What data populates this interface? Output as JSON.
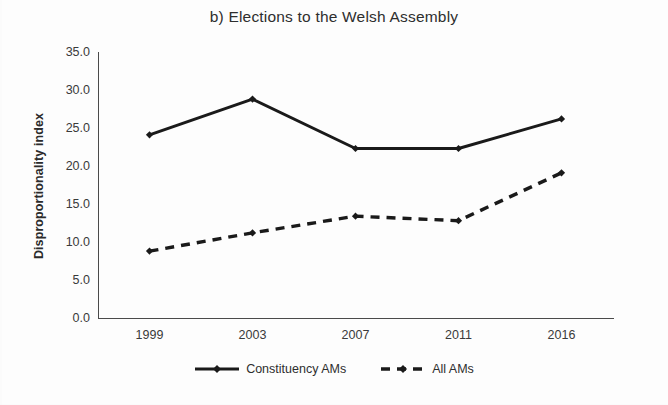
{
  "chart_data": {
    "type": "line",
    "title": "b) Elections to the Welsh Assembly",
    "xlabel": "",
    "ylabel": "Disproportionality index",
    "categories": [
      "1999",
      "2003",
      "2007",
      "2011",
      "2016"
    ],
    "series": [
      {
        "name": "Constituency AMs",
        "values": [
          24.1,
          28.8,
          22.3,
          22.3,
          26.2
        ],
        "line_style": "solid",
        "marker": "diamond",
        "color": "#1a1a1a"
      },
      {
        "name": "All AMs",
        "values": [
          8.8,
          11.2,
          13.4,
          12.8,
          19.1
        ],
        "line_style": "dashed",
        "marker": "diamond",
        "color": "#1a1a1a"
      }
    ],
    "ylim": [
      0.0,
      35.0
    ],
    "y_ticks": [
      "0.0",
      "5.0",
      "10.0",
      "15.0",
      "20.0",
      "25.0",
      "30.0",
      "35.0"
    ],
    "y_tick_step": 5.0,
    "grid": false,
    "legend_position": "bottom"
  }
}
